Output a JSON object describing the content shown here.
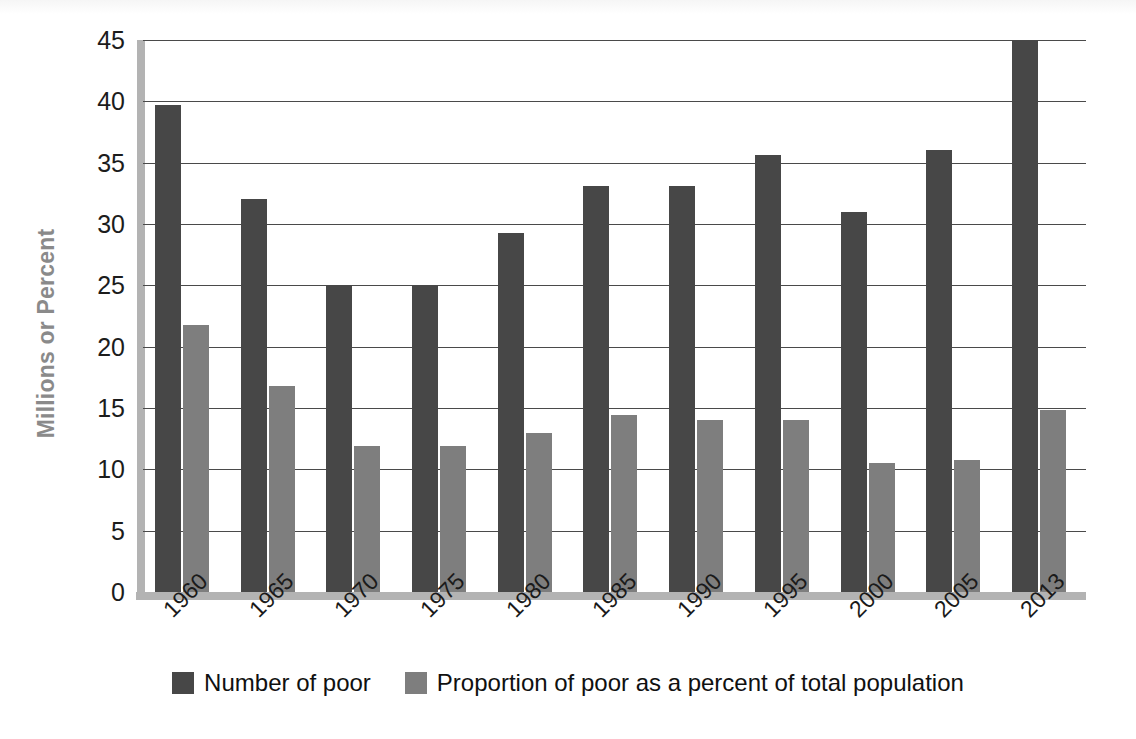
{
  "chart_data": {
    "type": "bar",
    "title": "",
    "xlabel": "",
    "ylabel": "Millions or Percent",
    "ylim": [
      0,
      45
    ],
    "ytick_step": 5,
    "yticks": [
      45,
      40,
      35,
      30,
      25,
      20,
      15,
      10,
      5,
      0
    ],
    "grid": true,
    "legend_position": "bottom",
    "categories": [
      "1960",
      "1965",
      "1970",
      "1975",
      "1980",
      "1985",
      "1990",
      "1995",
      "2000",
      "2005",
      "2013"
    ],
    "series": [
      {
        "name": "Number of poor",
        "color": "#474747",
        "values": [
          39.7,
          32.0,
          25.0,
          25.0,
          29.3,
          33.1,
          33.1,
          35.6,
          31.0,
          36.0,
          45.0
        ]
      },
      {
        "name": "Proportion of poor as a percent of total population",
        "color": "#7e7e7e",
        "values": [
          21.8,
          16.8,
          11.9,
          11.9,
          13.0,
          14.4,
          14.0,
          14.0,
          10.5,
          10.8,
          14.8
        ]
      }
    ]
  },
  "axis": {
    "y_title": "Millions or Percent"
  }
}
